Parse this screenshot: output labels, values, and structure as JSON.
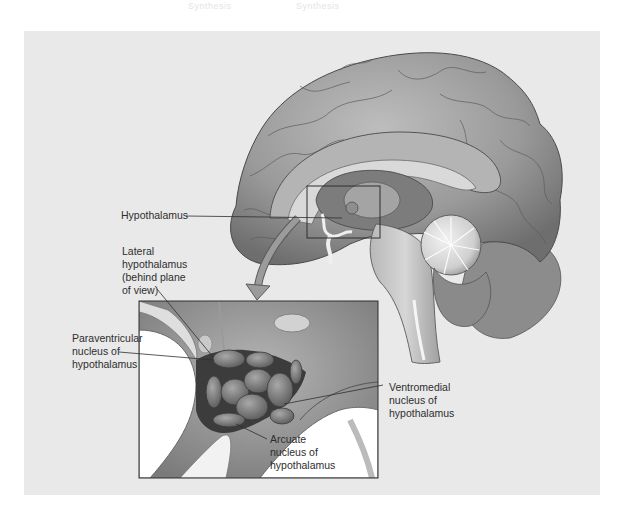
{
  "figure": {
    "background_panel_color": "#e9e9e9",
    "ink_color": "#2e2e2e",
    "bleed_through_text": [
      "Synthesis",
      "Synthesis"
    ]
  },
  "labels": {
    "hypothalamus": {
      "lines": [
        "Hypothalamus"
      ]
    },
    "lateral_hypothalamus": {
      "lines": [
        "Lateral",
        "hypothalamus",
        "(behind plane",
        "of view)"
      ]
    },
    "paraventricular": {
      "lines": [
        "Paraventricular",
        "nucleus of",
        "hypothalamus"
      ]
    },
    "ventromedial": {
      "lines": [
        "Ventromedial",
        "nucleus of",
        "hypothalamus"
      ]
    },
    "arcuate": {
      "lines": [
        "Arcuate",
        "nucleus of",
        "hypothalamus"
      ]
    }
  },
  "icons": {
    "zoom_arrow": "curved-down-arrow-icon"
  }
}
